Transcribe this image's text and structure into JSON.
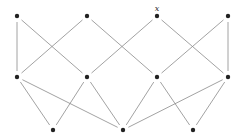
{
  "diagram": {
    "type": "hasse-diagram",
    "node_color": "#222222",
    "edge_color": "#8a8a8a",
    "node_radius": 2.2,
    "edge_gap": 6,
    "nodes": [
      {
        "id": "T0",
        "x": 17,
        "y": 16
      },
      {
        "id": "T1",
        "x": 87,
        "y": 16
      },
      {
        "id": "T2",
        "x": 157,
        "y": 16,
        "label": "x"
      },
      {
        "id": "T3",
        "x": 228,
        "y": 16
      },
      {
        "id": "M0",
        "x": 17,
        "y": 77
      },
      {
        "id": "M1",
        "x": 87,
        "y": 77
      },
      {
        "id": "M2",
        "x": 157,
        "y": 77
      },
      {
        "id": "M3",
        "x": 228,
        "y": 77
      },
      {
        "id": "B0",
        "x": 53,
        "y": 130
      },
      {
        "id": "B1",
        "x": 123,
        "y": 130
      },
      {
        "id": "B2",
        "x": 193,
        "y": 130
      }
    ],
    "edges": [
      [
        "T0",
        "M0"
      ],
      [
        "T0",
        "M1"
      ],
      [
        "T1",
        "M0"
      ],
      [
        "T1",
        "M2"
      ],
      [
        "T2",
        "M1"
      ],
      [
        "T2",
        "M3"
      ],
      [
        "T3",
        "M2"
      ],
      [
        "T3",
        "M3"
      ],
      [
        "M0",
        "B0"
      ],
      [
        "M0",
        "B1"
      ],
      [
        "M1",
        "B0"
      ],
      [
        "M1",
        "B1"
      ],
      [
        "M2",
        "B1"
      ],
      [
        "M2",
        "B2"
      ],
      [
        "M3",
        "B1"
      ],
      [
        "M3",
        "B2"
      ]
    ]
  }
}
